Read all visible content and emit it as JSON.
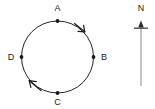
{
  "figure": {
    "background_color": "#ffffff",
    "stroke_color": "#262626",
    "label_color": "#1a1a1a",
    "circle": {
      "center_x": 57.5,
      "center_y": 57,
      "radius": 36,
      "direction": "clockwise"
    },
    "points": [
      {
        "id": "A",
        "label": "A",
        "angle_deg": 90,
        "x": 57.5,
        "y": 21,
        "label_x": 57.5,
        "label_y": 11
      },
      {
        "id": "B",
        "label": "B",
        "angle_deg": 0,
        "x": 93.5,
        "y": 57,
        "label_x": 104,
        "label_y": 60
      },
      {
        "id": "C",
        "label": "C",
        "angle_deg": 270,
        "x": 57.5,
        "y": 93,
        "label_x": 57.5,
        "label_y": 105
      },
      {
        "id": "D",
        "label": "D",
        "angle_deg": 180,
        "x": 21.5,
        "y": 57,
        "label_x": 11,
        "label_y": 60
      }
    ],
    "direction_arrows": [
      {
        "id": "arrow-upper-right",
        "position_deg": 55,
        "points_toward": "clockwise"
      },
      {
        "id": "arrow-lower-left",
        "position_deg": 235,
        "points_toward": "clockwise"
      }
    ],
    "compass": {
      "label": "N",
      "label_x": 141,
      "label_y": 11,
      "line_x": 141,
      "line_top_y": 22,
      "line_bottom_y": 86,
      "crossbar_y": 28,
      "crossbar_half_width": 7,
      "line_color": "#8a8a8a",
      "head_color": "#2b2b2b"
    }
  }
}
